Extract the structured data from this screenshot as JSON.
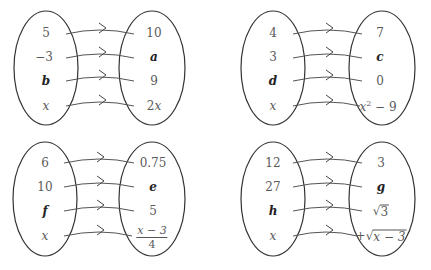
{
  "colors": {
    "stroke": "#333333",
    "text": "#5a5a5a",
    "variable": "#222222",
    "background": "#ffffff"
  },
  "diagrams": [
    {
      "id": "top-left",
      "domain": [
        {
          "text": "5",
          "kind": "num"
        },
        {
          "text": "−3",
          "kind": "num"
        },
        {
          "text": "b",
          "kind": "var"
        },
        {
          "text": "x",
          "kind": "it"
        }
      ],
      "range": [
        {
          "text": "10",
          "kind": "num"
        },
        {
          "text": "a",
          "kind": "var"
        },
        {
          "text": "9",
          "kind": "num"
        },
        {
          "text": "2x",
          "kind": "expr"
        }
      ],
      "rule": "x → 2x"
    },
    {
      "id": "top-right",
      "domain": [
        {
          "text": "4",
          "kind": "num"
        },
        {
          "text": "3",
          "kind": "num"
        },
        {
          "text": "d",
          "kind": "var"
        },
        {
          "text": "x",
          "kind": "it"
        }
      ],
      "range": [
        {
          "text": "7",
          "kind": "num"
        },
        {
          "text": "c",
          "kind": "var"
        },
        {
          "text": "0",
          "kind": "num"
        },
        {
          "text": "x² − 9",
          "kind": "expr"
        }
      ],
      "rule": "x → x² − 9"
    },
    {
      "id": "bottom-left",
      "domain": [
        {
          "text": "6",
          "kind": "num"
        },
        {
          "text": "10",
          "kind": "num"
        },
        {
          "text": "f",
          "kind": "var"
        },
        {
          "text": "x",
          "kind": "it"
        }
      ],
      "range": [
        {
          "text": "0.75",
          "kind": "num"
        },
        {
          "text": "e",
          "kind": "var"
        },
        {
          "text": "5",
          "kind": "num"
        },
        {
          "text": "(x − 3)/4",
          "kind": "frac",
          "numerator": "x − 3",
          "denominator": "4"
        }
      ],
      "rule": "x → (x − 3)/4"
    },
    {
      "id": "bottom-right",
      "domain": [
        {
          "text": "12",
          "kind": "num"
        },
        {
          "text": "27",
          "kind": "num"
        },
        {
          "text": "h",
          "kind": "var"
        },
        {
          "text": "x",
          "kind": "it"
        }
      ],
      "range": [
        {
          "text": "3",
          "kind": "num"
        },
        {
          "text": "g",
          "kind": "var"
        },
        {
          "text": "√3",
          "kind": "sqrt",
          "radicand": "3",
          "sign": ""
        },
        {
          "text": "+√(x − 3)",
          "kind": "sqrt",
          "radicand": "x − 3",
          "sign": "+"
        }
      ],
      "rule": "x → +√(x − 3)"
    }
  ]
}
